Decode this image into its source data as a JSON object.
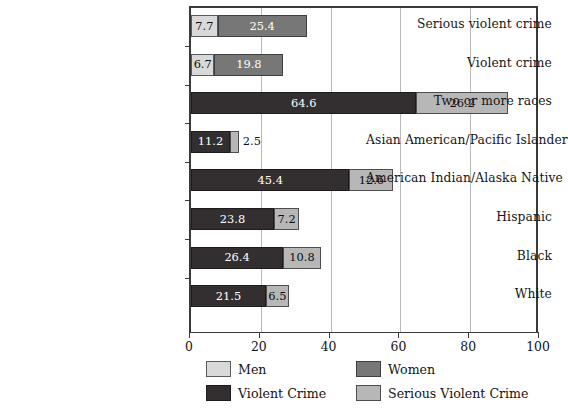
{
  "chart_data": {
    "type": "bar",
    "orientation": "horizontal",
    "stacked": true,
    "title": "",
    "subtitle": "",
    "xlabel": "",
    "ylabel": "",
    "xlim": [
      0,
      100
    ],
    "xticks": [
      0,
      20,
      40,
      60,
      80,
      100
    ],
    "xtick_labels": [
      "0",
      "20",
      "40",
      "60",
      "80",
      "100"
    ],
    "grid": true,
    "gridlines_at": [
      20,
      40,
      60,
      80
    ],
    "legend_position": "bottom",
    "categories": [
      "Serious violent crime",
      "Violent crime",
      "Two or more races",
      "Asian American/Pacific Islander",
      "American Indian/Alaska Native",
      "Hispanic",
      "Black",
      "White"
    ],
    "legend": [
      {
        "name": "Men",
        "color": "#d9d9d9"
      },
      {
        "name": "Women",
        "color": "#777777"
      },
      {
        "name": "Violent Crime",
        "color": "#332f30"
      },
      {
        "name": "Serious Violent Crime",
        "color": "#b7b7b7"
      }
    ],
    "bars": [
      {
        "category": "Serious violent crime",
        "segments": [
          {
            "series": "Men",
            "value": 7.7,
            "label": "7.7",
            "label_position": "inside"
          },
          {
            "series": "Women",
            "value": 25.4,
            "label": "25.4",
            "label_position": "inside"
          }
        ]
      },
      {
        "category": "Violent crime",
        "segments": [
          {
            "series": "Men",
            "value": 6.7,
            "label": "6.7",
            "label_position": "inside"
          },
          {
            "series": "Women",
            "value": 19.8,
            "label": "19.8",
            "label_position": "inside"
          }
        ]
      },
      {
        "category": "Two or more races",
        "segments": [
          {
            "series": "Violent Crime",
            "value": 64.6,
            "label": "64.6",
            "label_position": "inside"
          },
          {
            "series": "Serious Violent Crime",
            "value": 26.2,
            "label": "26.2",
            "label_position": "inside"
          }
        ]
      },
      {
        "category": "Asian American/Pacific Islander",
        "segments": [
          {
            "series": "Violent Crime",
            "value": 11.2,
            "label": "11.2",
            "label_position": "inside"
          },
          {
            "series": "Serious Violent Crime",
            "value": 2.5,
            "label": "2.5",
            "label_position": "outside"
          }
        ]
      },
      {
        "category": "American Indian/Alaska Native",
        "segments": [
          {
            "series": "Violent Crime",
            "value": 45.4,
            "label": "45.4",
            "label_position": "inside"
          },
          {
            "series": "Serious Violent Crime",
            "value": 12.6,
            "label": "12.6",
            "label_position": "inside"
          }
        ]
      },
      {
        "category": "Hispanic",
        "segments": [
          {
            "series": "Violent Crime",
            "value": 23.8,
            "label": "23.8",
            "label_position": "inside"
          },
          {
            "series": "Serious Violent Crime",
            "value": 7.2,
            "label": "7.2",
            "label_position": "inside"
          }
        ]
      },
      {
        "category": "Black",
        "segments": [
          {
            "series": "Violent Crime",
            "value": 26.4,
            "label": "26.4",
            "label_position": "inside"
          },
          {
            "series": "Serious Violent Crime",
            "value": 10.8,
            "label": "10.8",
            "label_position": "inside"
          }
        ]
      },
      {
        "category": "White",
        "segments": [
          {
            "series": "Violent Crime",
            "value": 21.5,
            "label": "21.5",
            "label_position": "inside"
          },
          {
            "series": "Serious Violent Crime",
            "value": 6.5,
            "label": "6.5",
            "label_position": "inside"
          }
        ]
      }
    ]
  },
  "colors": {
    "men": "#d9d9d9",
    "women": "#777777",
    "violent_crime": "#332f30",
    "serious_violent_crime": "#b7b7b7",
    "axis": "#3a3a3a",
    "gridline": "#b9b9b9",
    "background": "#ffffff"
  }
}
